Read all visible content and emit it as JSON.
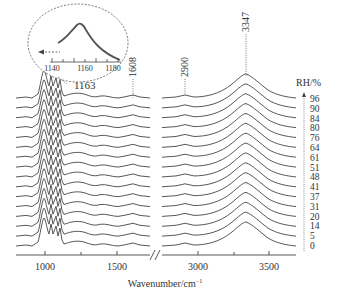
{
  "chart_data": {
    "type": "line",
    "title": "",
    "xlabel": "Wavenumber/cm⁻¹",
    "ylabel": "",
    "x_segments": [
      {
        "range": [
          800,
          1700
        ],
        "ticks": [
          1000,
          1500
        ]
      },
      {
        "range": [
          2600,
          3700
        ],
        "ticks": [
          3000,
          3500
        ]
      }
    ],
    "axis_break": "//",
    "xtick_labels": [
      "1000",
      "1500",
      "3000",
      "3500"
    ],
    "legend_title": "RH/%",
    "series_order_top_to_bottom": [
      "96",
      "90",
      "84",
      "80",
      "76",
      "64",
      "61",
      "51",
      "48",
      "41",
      "37",
      "31",
      "20",
      "14",
      "5",
      "0"
    ],
    "series": [
      {
        "name": "96"
      },
      {
        "name": "90"
      },
      {
        "name": "84"
      },
      {
        "name": "80"
      },
      {
        "name": "76"
      },
      {
        "name": "64"
      },
      {
        "name": "61"
      },
      {
        "name": "51"
      },
      {
        "name": "48"
      },
      {
        "name": "41"
      },
      {
        "name": "37"
      },
      {
        "name": "31"
      },
      {
        "name": "20"
      },
      {
        "name": "14"
      },
      {
        "name": "5"
      },
      {
        "name": "0"
      }
    ],
    "peak_annotations": [
      "1163",
      "1608",
      "2900",
      "3347"
    ],
    "inset": {
      "xticks": [
        "1140",
        "1160",
        "1180"
      ],
      "note": "peak near 1163 shifting left with increasing RH (dashed arrow)"
    },
    "grid": false,
    "legend_position": "right"
  },
  "labels": {
    "peak_1163": "1163",
    "peak_1608": "1608",
    "peak_2900": "2900",
    "peak_3347": "3347",
    "rh_title": "RH/%",
    "xlabel": "Wavenumber/cm",
    "xlabel_sup": "−1",
    "tick_1000": "1000",
    "tick_1500": "1500",
    "tick_3000": "3000",
    "tick_3500": "3500",
    "inset_1140": "1140",
    "inset_1160": "1160",
    "inset_1180": "1180",
    "rh": [
      "96",
      "90",
      "84",
      "80",
      "76",
      "64",
      "61",
      "51",
      "48",
      "41",
      "37",
      "31",
      "20",
      "14",
      "5",
      "0"
    ]
  }
}
